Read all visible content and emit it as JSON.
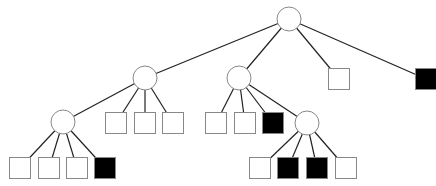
{
  "diagram": {
    "type": "tree",
    "width": 436,
    "height": 186,
    "colors": {
      "background": "#ffffff",
      "edge": "#222222",
      "outline": "#888888",
      "empty_fill": "#ffffff",
      "filled_fill": "#000000"
    },
    "circle_radius": 12,
    "square_size": 21,
    "nodes": [
      {
        "id": "root",
        "shape": "circle",
        "x": 289,
        "y": 19,
        "filled": false
      },
      {
        "id": "A",
        "shape": "circle",
        "x": 145,
        "y": 78,
        "filled": false,
        "parent": "root"
      },
      {
        "id": "B",
        "shape": "circle",
        "x": 239,
        "y": 78,
        "filled": false,
        "parent": "root"
      },
      {
        "id": "C",
        "shape": "square",
        "x": 339,
        "y": 79,
        "filled": false,
        "parent": "root"
      },
      {
        "id": "D",
        "shape": "square",
        "x": 426,
        "y": 79,
        "filled": true,
        "parent": "root"
      },
      {
        "id": "A1",
        "shape": "circle",
        "x": 63,
        "y": 122,
        "filled": false,
        "parent": "A"
      },
      {
        "id": "A2",
        "shape": "square",
        "x": 116,
        "y": 123,
        "filled": false,
        "parent": "A"
      },
      {
        "id": "A3",
        "shape": "square",
        "x": 145,
        "y": 123,
        "filled": false,
        "parent": "A"
      },
      {
        "id": "A4",
        "shape": "square",
        "x": 173,
        "y": 123,
        "filled": false,
        "parent": "A"
      },
      {
        "id": "A1a",
        "shape": "square",
        "x": 20,
        "y": 168,
        "filled": false,
        "parent": "A1"
      },
      {
        "id": "A1b",
        "shape": "square",
        "x": 49,
        "y": 168,
        "filled": false,
        "parent": "A1"
      },
      {
        "id": "A1c",
        "shape": "square",
        "x": 77,
        "y": 168,
        "filled": false,
        "parent": "A1"
      },
      {
        "id": "A1d",
        "shape": "square",
        "x": 105,
        "y": 168,
        "filled": true,
        "parent": "A1"
      },
      {
        "id": "B1",
        "shape": "square",
        "x": 216,
        "y": 123,
        "filled": false,
        "parent": "B"
      },
      {
        "id": "B2",
        "shape": "square",
        "x": 245,
        "y": 123,
        "filled": false,
        "parent": "B"
      },
      {
        "id": "B3",
        "shape": "square",
        "x": 273,
        "y": 123,
        "filled": true,
        "parent": "B"
      },
      {
        "id": "B4",
        "shape": "circle",
        "x": 307,
        "y": 123,
        "filled": false,
        "parent": "B"
      },
      {
        "id": "B4a",
        "shape": "square",
        "x": 260,
        "y": 168,
        "filled": false,
        "parent": "B4"
      },
      {
        "id": "B4b",
        "shape": "square",
        "x": 288,
        "y": 168,
        "filled": true,
        "parent": "B4"
      },
      {
        "id": "B4c",
        "shape": "square",
        "x": 317,
        "y": 168,
        "filled": true,
        "parent": "B4"
      },
      {
        "id": "B4d",
        "shape": "square",
        "x": 346,
        "y": 168,
        "filled": false,
        "parent": "B4"
      }
    ]
  }
}
